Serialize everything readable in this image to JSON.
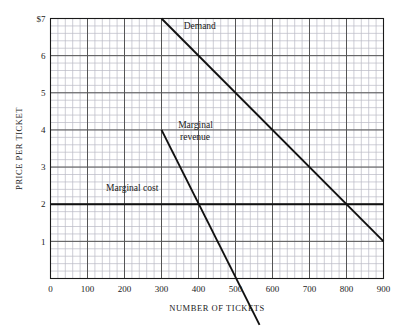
{
  "chart_data": {
    "type": "line",
    "title": "",
    "xlabel": "NUMBER OF TICKETS",
    "ylabel": "PRICE PER TICKET",
    "xlim": [
      0,
      900
    ],
    "ylim": [
      0,
      7
    ],
    "xticks": [
      0,
      100,
      200,
      300,
      400,
      500,
      600,
      700,
      800,
      900
    ],
    "xtick_labels": [
      "0",
      "100",
      "200",
      "300",
      "400",
      "500",
      "600",
      "700",
      "800",
      "900"
    ],
    "yticks": [
      1,
      2,
      3,
      4,
      5,
      6,
      7
    ],
    "ytick_labels": [
      "1",
      "2",
      "3",
      "4",
      "5",
      "6",
      "7"
    ],
    "ytop_label": "$7",
    "grid": true,
    "grid_major_x_step": 100,
    "grid_major_y_step": 1,
    "grid_minor_x_step": 20,
    "grid_minor_y_step": 0.2,
    "legend_position": "inline-annotations",
    "series": [
      {
        "name": "Demand",
        "label": "Demand",
        "color": "#111111",
        "points": [
          [
            300,
            7
          ],
          [
            900,
            1
          ]
        ],
        "label_x": 360,
        "label_y": 6.72
      },
      {
        "name": "Marginal revenue",
        "label": "Marginal revenue",
        "label_line1": "Marginal",
        "label_line2": "revenue",
        "color": "#111111",
        "points": [
          [
            300,
            4
          ],
          [
            565,
            -1.25
          ]
        ],
        "label_x": 345,
        "label_y": 4.0
      },
      {
        "name": "Marginal cost",
        "label": "Marginal cost",
        "color": "#111111",
        "points": [
          [
            0,
            2
          ],
          [
            900,
            2
          ]
        ],
        "label_x": 150,
        "label_y": 2.35
      }
    ],
    "annotations": [
      {
        "text": "Demand",
        "x": 360,
        "y": 6.72
      },
      {
        "text": "Marginal",
        "x": 345,
        "y": 4.05
      },
      {
        "text": "revenue",
        "x": 350,
        "y": 3.72
      },
      {
        "text": "Marginal cost",
        "x": 150,
        "y": 2.35
      }
    ],
    "intersections": [
      {
        "label": "MR = MC",
        "x": 400,
        "y": 2
      },
      {
        "label": "Demand = MC",
        "x": 800,
        "y": 2
      }
    ]
  },
  "colors": {
    "background": "#ffffff",
    "axis": "#1a1a1a",
    "grid_major": "#555555",
    "grid_minor": "#b9b9c4",
    "line": "#111111",
    "text": "#1a1a1a"
  }
}
